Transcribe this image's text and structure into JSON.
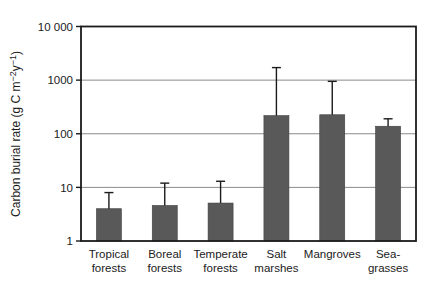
{
  "figure": {
    "background": "#ffffff"
  },
  "chart_data": {
    "type": "bar",
    "title": "",
    "xlabel": "",
    "ylabel": "Carbon burial rate (g C m⁻²y⁻¹)",
    "ylabel_parts": [
      {
        "t": "Carbon burial rate (g C m",
        "sup": false
      },
      {
        "t": "−2",
        "sup": true
      },
      {
        "t": "y",
        "sup": false
      },
      {
        "t": "−1",
        "sup": true
      },
      {
        "t": ")",
        "sup": false
      }
    ],
    "y_scale": "log10",
    "ylim": [
      1,
      10000
    ],
    "yticks": [
      {
        "value": 1,
        "label": "1"
      },
      {
        "value": 10,
        "label": "10"
      },
      {
        "value": 100,
        "label": "100"
      },
      {
        "value": 1000,
        "label": "1000"
      },
      {
        "value": 10000,
        "label": "10 000"
      }
    ],
    "gridlines_at": [
      10,
      100,
      1000
    ],
    "grid": true,
    "legend": "none",
    "categories": [
      "Tropical forests",
      "Boreal forests",
      "Temperate forests",
      "Salt marshes",
      "Mangroves",
      "Sea-grasses"
    ],
    "category_label_lines": [
      [
        "Tropical",
        "forests"
      ],
      [
        "Boreal",
        "forests"
      ],
      [
        "Temperate",
        "forests"
      ],
      [
        "Salt",
        "marshes"
      ],
      [
        "Mangroves"
      ],
      [
        "Sea-",
        "grasses"
      ]
    ],
    "values": [
      4.0,
      4.6,
      5.1,
      218,
      226,
      138
    ],
    "error_upper": [
      8,
      12,
      13,
      1713,
      949,
      190
    ],
    "colors": {
      "bar_fill": "#595959",
      "bar_edge": "#3f3f3f",
      "gridline": "#8a8a8a",
      "axis": "#1b1b1b",
      "error_bar": "#1b1b1b",
      "text": "#1b1b1b",
      "background": "#ffffff"
    }
  }
}
